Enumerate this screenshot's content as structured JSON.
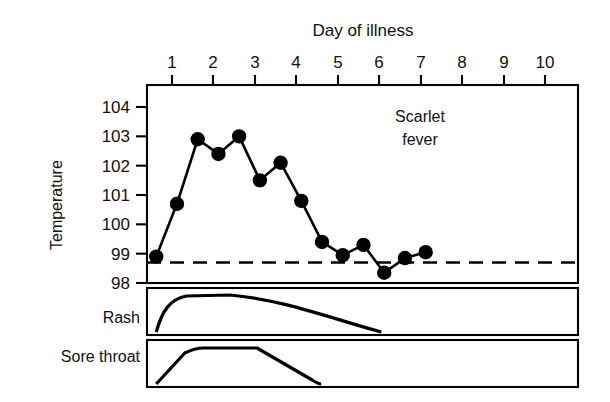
{
  "figure": {
    "title": "Day of illness",
    "annotation_line1": "Scarlet",
    "annotation_line2": "fever",
    "y_axis_label": "Temperature",
    "panel_labels": {
      "rash": "Rash",
      "sore_throat": "Sore throat"
    },
    "ink_color": "#000000",
    "background_color": "#ffffff"
  },
  "chart_data": {
    "type": "line",
    "title": "Day of illness",
    "subtitle": "Scarlet fever",
    "xlabel": "Day of illness",
    "ylabel": "Temperature",
    "xlim": [
      0,
      10
    ],
    "ylim": [
      98,
      104
    ],
    "grid": false,
    "legend": "none",
    "x_ticks": [
      "1",
      "2",
      "3",
      "4",
      "5",
      "6",
      "7",
      "8",
      "9",
      "10"
    ],
    "x_tick_values": [
      1,
      2,
      3,
      4,
      5,
      6,
      7,
      8,
      9,
      10
    ],
    "y_ticks": [
      "104",
      "103",
      "102",
      "101",
      "100",
      "99",
      "98"
    ],
    "y_tick_values": [
      104,
      103,
      102,
      101,
      100,
      99,
      98
    ],
    "series": [
      {
        "name": "Temperature",
        "marker": "filled-circle",
        "x": [
          0.62,
          1.12,
          1.62,
          2.12,
          2.62,
          3.12,
          3.62,
          4.12,
          4.62,
          5.12,
          5.62,
          6.12,
          6.62,
          7.12
        ],
        "values": [
          98.9,
          100.7,
          102.9,
          102.4,
          103.0,
          101.5,
          102.1,
          100.8,
          99.4,
          98.95,
          99.3,
          98.35,
          98.85,
          99.05
        ]
      }
    ],
    "reference_line": {
      "name": "normal-temperature-baseline",
      "value": 98.7,
      "style": "dashed"
    },
    "sub_panels": [
      {
        "name": "Rash",
        "shape": "rounded-plateau",
        "onset_day": 0.62,
        "peak_start_day": 1.35,
        "peak_end_day": 2.4,
        "offset_day": 6.05
      },
      {
        "name": "Sore throat",
        "shape": "trapezoid",
        "onset_day": 0.62,
        "peak_start_day": 1.55,
        "peak_end_day": 3.05,
        "offset_day": 4.6
      }
    ]
  }
}
